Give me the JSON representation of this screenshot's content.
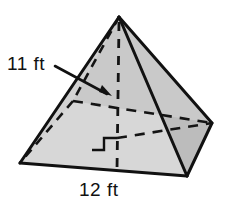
{
  "figure": {
    "shape_name": "square pyramid",
    "labels": {
      "height": "11 ft",
      "base_edge": "12 ft"
    },
    "colors": {
      "outline": "#111111",
      "face_front_left": "#d7d7d7",
      "face_front_right": "#bdbdbd",
      "face_back_right": "#c9c9c9",
      "background": "#ffffff",
      "dashed_hidden": "#1a1a1a",
      "text": "#111111"
    },
    "geometry": {
      "apex": [
        119,
        17
      ],
      "base_front_left": [
        20,
        163
      ],
      "base_front_right": [
        187,
        176
      ],
      "base_back_right": [
        212,
        123
      ],
      "base_back_left": [
        73,
        101
      ],
      "base_center": [
        117,
        138
      ],
      "altitude_foot": [
        117,
        170
      ]
    },
    "annotations": {
      "arrow_from": [
        55,
        66
      ],
      "arrow_to": [
        111,
        96
      ],
      "right_angle_marker": "square-corner-at-base-center",
      "hidden_edges": "dashed lines show back-left base vertex, base diagonals and vertical altitude"
    }
  }
}
